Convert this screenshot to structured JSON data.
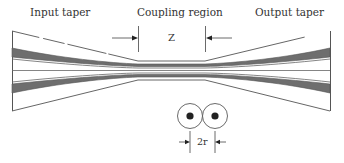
{
  "labels": {
    "input_taper": "Input taper",
    "coupling_region": "Coupling region",
    "output_taper": "Output taper",
    "coupling_length": "Z",
    "diameter": "2r"
  },
  "colors": {
    "line": "#555555",
    "core_fill": "#6e6e6e",
    "dot": "#222222"
  }
}
